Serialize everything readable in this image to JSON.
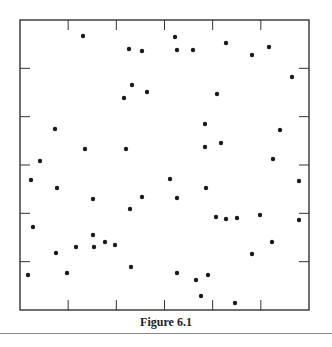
{
  "caption": "Figure 6.1",
  "colors": {
    "axis": "#333333",
    "point": "#1a1a1a",
    "rule": "#888888"
  },
  "frame": {
    "left": 20,
    "top": 20,
    "right": 309,
    "bottom": 310
  },
  "chart_data": {
    "type": "scatter",
    "title": "",
    "caption": "Figure 6.1",
    "xlabel": "",
    "ylabel": "",
    "xlim": [
      0,
      6
    ],
    "ylim": [
      0,
      6
    ],
    "grid": false,
    "ticks": {
      "x": [
        1,
        2,
        3,
        4,
        5
      ],
      "y": [
        1,
        2,
        3,
        4,
        5
      ],
      "labels": false
    },
    "points_px": [
      [
        83,
        36
      ],
      [
        129,
        49
      ],
      [
        142,
        51
      ],
      [
        175,
        37
      ],
      [
        177,
        50
      ],
      [
        193,
        50
      ],
      [
        226,
        43
      ],
      [
        252,
        55
      ],
      [
        269,
        47
      ],
      [
        292,
        77
      ],
      [
        132,
        85
      ],
      [
        147,
        92
      ],
      [
        124,
        98
      ],
      [
        217,
        94
      ],
      [
        55,
        129
      ],
      [
        85,
        149
      ],
      [
        126,
        149
      ],
      [
        205,
        124
      ],
      [
        205,
        147
      ],
      [
        221,
        143
      ],
      [
        280,
        130
      ],
      [
        40,
        161
      ],
      [
        31,
        180
      ],
      [
        57,
        188
      ],
      [
        170,
        179
      ],
      [
        206,
        188
      ],
      [
        273,
        159
      ],
      [
        299,
        181
      ],
      [
        93,
        199
      ],
      [
        142,
        197
      ],
      [
        177,
        198
      ],
      [
        130,
        209
      ],
      [
        33,
        227
      ],
      [
        216,
        217
      ],
      [
        226,
        219
      ],
      [
        237,
        218
      ],
      [
        260,
        215
      ],
      [
        299,
        220
      ],
      [
        272,
        242
      ],
      [
        56,
        253
      ],
      [
        76,
        247
      ],
      [
        94,
        247
      ],
      [
        105,
        242
      ],
      [
        93,
        235
      ],
      [
        115,
        245
      ],
      [
        28,
        275
      ],
      [
        67,
        273
      ],
      [
        131,
        267
      ],
      [
        177,
        273
      ],
      [
        196,
        280
      ],
      [
        208,
        275
      ],
      [
        201,
        296
      ],
      [
        235,
        303
      ],
      [
        252,
        254
      ]
    ]
  }
}
